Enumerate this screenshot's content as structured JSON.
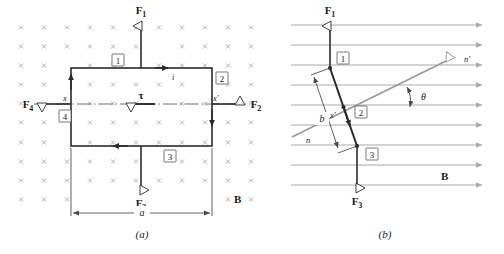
{
  "figure": {
    "panels": [
      {
        "id": "a",
        "caption": "(a)",
        "view": "face-on view of rectangular current loop in uniform field into the page",
        "field_label": "B",
        "field_symbol": "x",
        "width_label": "a",
        "current_label": "i",
        "torque_label": "τ",
        "axis_left_label": "x",
        "axis_right_label": "x′",
        "forces": [
          {
            "name": "F1",
            "base": "F",
            "sub": "1",
            "direction": "up"
          },
          {
            "name": "F2",
            "base": "F",
            "sub": "2",
            "direction": "right"
          },
          {
            "name": "F3",
            "base": "F",
            "sub": "3",
            "direction": "down"
          },
          {
            "name": "F4",
            "base": "F",
            "sub": "4",
            "direction": "left"
          }
        ],
        "side_numbers": [
          "1",
          "2",
          "3",
          "4"
        ]
      },
      {
        "id": "b",
        "caption": "(b)",
        "view": "edge-on view of the tilted loop",
        "field_label": "B",
        "normal_label": "n",
        "normal_prime_label": "n′",
        "angle_label": "θ",
        "height_label": "b",
        "axis_right_label": "x′",
        "forces": [
          {
            "name": "F1",
            "base": "F",
            "sub": "1",
            "direction": "up"
          },
          {
            "name": "F3",
            "base": "F",
            "sub": "3",
            "direction": "down"
          }
        ],
        "side_numbers": [
          "1",
          "2",
          "3"
        ]
      }
    ]
  },
  "colors": {
    "ink": "#1a1a1a",
    "loop": "#2b2b2b",
    "field_gray": "#a9a9ad",
    "normal_gray": "#9a9a9e",
    "thin": "#4a4a4a",
    "paper": "#ffffff"
  }
}
